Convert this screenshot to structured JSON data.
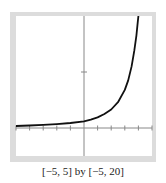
{
  "chart_data": {
    "type": "line",
    "title": "",
    "xlabel": "",
    "ylabel": "",
    "xlim": [
      -5,
      5
    ],
    "ylim": [
      -5,
      20
    ],
    "xticks": [
      -5,
      -4,
      -3,
      -2,
      -1,
      1,
      2,
      3,
      4,
      5
    ],
    "yticks": [
      10
    ],
    "grid": false,
    "caption": "[−5, 5] by [−5, 20]",
    "series": [
      {
        "name": "curve",
        "x": [
          -5,
          -4,
          -3,
          -2,
          -1,
          0,
          0.5,
          1,
          1.5,
          2,
          2.5,
          3,
          3.25,
          3.5,
          3.7,
          3.85,
          3.95,
          4.0
        ],
        "y": [
          0.35,
          0.45,
          0.55,
          0.7,
          0.9,
          1.2,
          1.5,
          1.9,
          2.5,
          3.3,
          4.6,
          6.8,
          8.5,
          11.0,
          13.8,
          16.5,
          18.8,
          20.0
        ]
      }
    ],
    "colors": {
      "curve": "#111111",
      "axis": "#888888",
      "frame": "#dcdcdc",
      "plot_bg": "#ffffff"
    }
  }
}
